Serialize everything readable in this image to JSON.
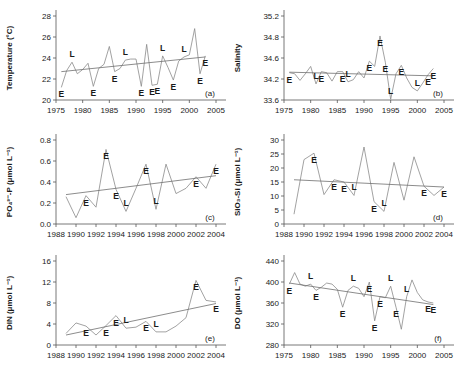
{
  "figure": {
    "panels": [
      "a",
      "b",
      "c",
      "d",
      "e",
      "f"
    ]
  },
  "chart_data": [
    {
      "type": "line",
      "panel": "a",
      "title": "",
      "xlabel": "",
      "ylabel": "Temperature (°C)",
      "xlim": [
        1975,
        2005
      ],
      "ylim": [
        20,
        28
      ],
      "xticks": [
        1975,
        1980,
        1985,
        1990,
        1995,
        2000,
        2005
      ],
      "yticks": [
        20,
        22,
        24,
        26,
        28
      ],
      "grid": false,
      "legend": "none",
      "x": [
        1976,
        1977,
        1978,
        1979,
        1980,
        1981,
        1982,
        1983,
        1984,
        1985,
        1986,
        1987,
        1988,
        1989,
        1990,
        1991,
        1992,
        1993,
        1994,
        1995,
        1996,
        1997,
        1998,
        1999,
        2000,
        2001,
        2002,
        2003
      ],
      "values": [
        21.2,
        22.8,
        23.6,
        22.5,
        22.9,
        23.5,
        21.3,
        23.0,
        23.4,
        25.1,
        22.7,
        23.0,
        23.8,
        23.9,
        23.9,
        21.3,
        25.3,
        21.4,
        21.5,
        24.2,
        23.1,
        21.9,
        23.7,
        24.1,
        24.3,
        26.8,
        22.5,
        24.2
      ],
      "trend": {
        "x": [
          1976,
          2003
        ],
        "y": [
          22.7,
          24.1
        ]
      },
      "event_labels": [
        {
          "x": 1976,
          "y": 21.2,
          "text": "E"
        },
        {
          "x": 1978,
          "y": 23.6,
          "text": "L"
        },
        {
          "x": 1982,
          "y": 21.3,
          "text": "E"
        },
        {
          "x": 1986,
          "y": 22.7,
          "text": "E"
        },
        {
          "x": 1988,
          "y": 23.8,
          "text": "L"
        },
        {
          "x": 1991,
          "y": 21.3,
          "text": "E"
        },
        {
          "x": 1993,
          "y": 21.4,
          "text": "E"
        },
        {
          "x": 1994,
          "y": 21.5,
          "text": "E"
        },
        {
          "x": 1995,
          "y": 24.2,
          "text": "L"
        },
        {
          "x": 1997,
          "y": 21.9,
          "text": "E"
        },
        {
          "x": 1999,
          "y": 24.1,
          "text": "L"
        },
        {
          "x": 2002,
          "y": 22.5,
          "text": "E"
        },
        {
          "x": 2003,
          "y": 24.2,
          "text": "E"
        }
      ]
    },
    {
      "type": "line",
      "panel": "b",
      "title": "",
      "xlabel": "",
      "ylabel": "Salinity",
      "xlim": [
        1975,
        2005
      ],
      "ylim": [
        33.6,
        35.2
      ],
      "xticks": [
        1975,
        1980,
        1985,
        1990,
        1995,
        2000,
        2005
      ],
      "yticks": [
        33.6,
        34.2,
        34.6,
        34.8,
        35.2
      ],
      "grid": false,
      "legend": "none",
      "x": [
        1976,
        1977,
        1978,
        1979,
        1980,
        1981,
        1982,
        1983,
        1984,
        1985,
        1986,
        1987,
        1988,
        1989,
        1990,
        1991,
        1992,
        1993,
        1994,
        1995,
        1996,
        1997,
        1998,
        1999,
        2000,
        2001,
        2002,
        2003
      ],
      "values": [
        34.32,
        34.3,
        34.16,
        34.3,
        34.44,
        34.06,
        34.34,
        34.32,
        34.14,
        34.34,
        34.34,
        34.12,
        34.18,
        34.34,
        34.22,
        34.54,
        34.44,
        34.82,
        34.52,
        33.62,
        34.3,
        34.46,
        34.22,
        33.96,
        33.86,
        34.08,
        34.28,
        34.4
      ],
      "trend": {
        "x": [
          1976,
          2003
        ],
        "y": [
          34.33,
          34.26
        ]
      },
      "event_labels": [
        {
          "x": 1976,
          "y": 34.32,
          "text": "E"
        },
        {
          "x": 1981,
          "y": 34.06,
          "text": "L"
        },
        {
          "x": 1982,
          "y": 34.34,
          "text": "E"
        },
        {
          "x": 1986,
          "y": 34.34,
          "text": "E"
        },
        {
          "x": 1987,
          "y": 34.12,
          "text": "L"
        },
        {
          "x": 1991,
          "y": 34.54,
          "text": "E"
        },
        {
          "x": 1993,
          "y": 34.82,
          "text": "E"
        },
        {
          "x": 1994,
          "y": 34.52,
          "text": "E"
        },
        {
          "x": 1995,
          "y": 33.62,
          "text": "L"
        },
        {
          "x": 1997,
          "y": 34.46,
          "text": "E"
        },
        {
          "x": 2000,
          "y": 33.86,
          "text": "L"
        },
        {
          "x": 2002,
          "y": 34.28,
          "text": "E"
        },
        {
          "x": 2003,
          "y": 34.4,
          "text": "E"
        }
      ]
    },
    {
      "type": "line",
      "panel": "c",
      "title": "",
      "xlabel": "",
      "ylabel": "PO₄³⁻-P (μmol L⁻¹)",
      "xlim": [
        1988,
        2004
      ],
      "ylim": [
        0,
        0.8
      ],
      "xticks": [
        1988,
        1990,
        1992,
        1994,
        1996,
        1998,
        2000,
        2002,
        2004
      ],
      "yticks": [
        0,
        0.2,
        0.4,
        0.6,
        0.8
      ],
      "grid": false,
      "legend": "none",
      "x": [
        1989,
        1990,
        1991,
        1992,
        1993,
        1994,
        1995,
        1996,
        1997,
        1998,
        1999,
        2000,
        2001,
        2002,
        2003,
        2004
      ],
      "values": [
        0.26,
        0.06,
        0.27,
        0.16,
        0.71,
        0.33,
        0.12,
        0.34,
        0.57,
        0.14,
        0.57,
        0.29,
        0.34,
        0.45,
        0.34,
        0.57
      ],
      "trend": {
        "x": [
          1989,
          2004
        ],
        "y": [
          0.28,
          0.46
        ]
      },
      "event_labels": [
        {
          "x": 1991,
          "y": 0.27,
          "text": "E"
        },
        {
          "x": 1993,
          "y": 0.71,
          "text": "E"
        },
        {
          "x": 1994,
          "y": 0.33,
          "text": "E"
        },
        {
          "x": 1995,
          "y": 0.12,
          "text": "L"
        },
        {
          "x": 1997,
          "y": 0.57,
          "text": "E"
        },
        {
          "x": 1998,
          "y": 0.14,
          "text": "L"
        },
        {
          "x": 2002,
          "y": 0.45,
          "text": "E"
        },
        {
          "x": 2004,
          "y": 0.57,
          "text": "E"
        }
      ]
    },
    {
      "type": "line",
      "panel": "d",
      "title": "",
      "xlabel": "",
      "ylabel": "SiO₃-Si (μmol L⁻¹)",
      "xlim": [
        1988,
        2004
      ],
      "ylim": [
        0,
        30
      ],
      "xticks": [
        1988,
        1990,
        1992,
        1994,
        1996,
        1998,
        2000,
        2002,
        2004
      ],
      "yticks": [
        0,
        5,
        10,
        15,
        20,
        25,
        30
      ],
      "grid": false,
      "legend": "none",
      "x": [
        1989,
        1990,
        1991,
        1992,
        1993,
        1994,
        1995,
        1996,
        1997,
        1998,
        1999,
        2000,
        2001,
        2002,
        2003,
        2004
      ],
      "values": [
        3.5,
        23.0,
        25.3,
        10.5,
        15.8,
        15.0,
        10.2,
        27.5,
        8.0,
        4.5,
        22.0,
        8.5,
        24.0,
        13.5,
        10.2,
        13.2
      ],
      "trend": {
        "x": [
          1989,
          2004
        ],
        "y": [
          15.8,
          13.2
        ]
      },
      "event_labels": [
        {
          "x": 1991,
          "y": 25.3,
          "text": "E"
        },
        {
          "x": 1993,
          "y": 15.8,
          "text": "E"
        },
        {
          "x": 1994,
          "y": 15.0,
          "text": "E"
        },
        {
          "x": 1995,
          "y": 10.2,
          "text": "L"
        },
        {
          "x": 1997,
          "y": 8.0,
          "text": "E"
        },
        {
          "x": 1998,
          "y": 4.5,
          "text": "L"
        },
        {
          "x": 2002,
          "y": 13.5,
          "text": "E"
        },
        {
          "x": 2004,
          "y": 13.2,
          "text": "E"
        }
      ]
    },
    {
      "type": "line",
      "panel": "e",
      "title": "",
      "xlabel": "",
      "ylabel": "DIN (μmol L⁻¹)",
      "xlim": [
        1988,
        2004
      ],
      "ylim": [
        0,
        16
      ],
      "xticks": [
        1988,
        1990,
        1992,
        1994,
        1996,
        1998,
        2000,
        2002,
        2004
      ],
      "yticks": [
        0,
        4,
        8,
        12,
        16
      ],
      "grid": false,
      "legend": "none",
      "x": [
        1989,
        1990,
        1991,
        1992,
        1993,
        1994,
        1995,
        1996,
        1997,
        1998,
        1999,
        2000,
        2001,
        2002,
        2003,
        2004
      ],
      "values": [
        2.2,
        4.2,
        3.6,
        1.9,
        3.7,
        5.6,
        3.2,
        3.4,
        4.5,
        2.5,
        2.5,
        3.6,
        5.2,
        12.3,
        8.5,
        8.2
      ],
      "trend": {
        "x": [
          1989,
          2004
        ],
        "y": [
          1.9,
          7.9
        ]
      },
      "event_labels": [
        {
          "x": 1991,
          "y": 3.6,
          "text": "E"
        },
        {
          "x": 1993,
          "y": 3.7,
          "text": "E"
        },
        {
          "x": 1994,
          "y": 5.6,
          "text": "E"
        },
        {
          "x": 1995,
          "y": 3.2,
          "text": "L"
        },
        {
          "x": 1997,
          "y": 4.5,
          "text": "E"
        },
        {
          "x": 1998,
          "y": 2.5,
          "text": "L"
        },
        {
          "x": 2002,
          "y": 12.3,
          "text": "E"
        },
        {
          "x": 2004,
          "y": 8.2,
          "text": "E"
        }
      ]
    },
    {
      "type": "line",
      "panel": "f",
      "title": "",
      "xlabel": "",
      "ylabel": "DO (μmol L⁻¹)",
      "xlim": [
        1975,
        2005
      ],
      "ylim": [
        280,
        440
      ],
      "xticks": [
        1975,
        1980,
        1985,
        1990,
        1995,
        2000,
        2005
      ],
      "yticks": [
        280,
        320,
        360,
        400,
        440
      ],
      "grid": false,
      "legend": "none",
      "x": [
        1976,
        1977,
        1978,
        1979,
        1980,
        1981,
        1982,
        1983,
        1984,
        1985,
        1986,
        1987,
        1988,
        1989,
        1990,
        1991,
        1992,
        1993,
        1994,
        1995,
        1996,
        1997,
        1998,
        1999,
        2000,
        2001,
        2002,
        2003
      ],
      "values": [
        396,
        418,
        396,
        392,
        396,
        384,
        390,
        398,
        396,
        386,
        352,
        384,
        392,
        388,
        372,
        400,
        326,
        372,
        370,
        392,
        352,
        310,
        372,
        404,
        380,
        366,
        362,
        360
      ],
      "trend": {
        "x": [
          1976,
          2003
        ],
        "y": [
          398,
          357
        ]
      },
      "event_labels": [
        {
          "x": 1976,
          "y": 396,
          "text": "E"
        },
        {
          "x": 1980,
          "y": 396,
          "text": "L"
        },
        {
          "x": 1981,
          "y": 384,
          "text": "E"
        },
        {
          "x": 1986,
          "y": 352,
          "text": "E"
        },
        {
          "x": 1988,
          "y": 392,
          "text": "L"
        },
        {
          "x": 1991,
          "y": 400,
          "text": "E"
        },
        {
          "x": 1992,
          "y": 326,
          "text": "E"
        },
        {
          "x": 1993,
          "y": 372,
          "text": "E"
        },
        {
          "x": 1995,
          "y": 392,
          "text": "L"
        },
        {
          "x": 1996,
          "y": 352,
          "text": "E"
        },
        {
          "x": 1998,
          "y": 372,
          "text": "L"
        },
        {
          "x": 2002,
          "y": 362,
          "text": "E"
        },
        {
          "x": 2003,
          "y": 360,
          "text": "E"
        }
      ]
    }
  ]
}
